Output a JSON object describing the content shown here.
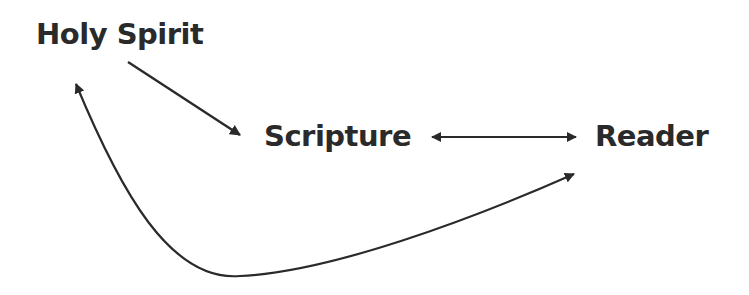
{
  "diagram": {
    "type": "flow-diagram",
    "colors": {
      "background": "#ffffff",
      "ink": "#2a2a2a"
    },
    "nodes": [
      {
        "id": "holy-spirit",
        "label": "Holy Spirit"
      },
      {
        "id": "scripture",
        "label": "Scripture"
      },
      {
        "id": "reader",
        "label": "Reader"
      }
    ],
    "edges": [
      {
        "from": "Holy Spirit",
        "to": "Scripture",
        "direction": "one-way",
        "shape": "straight"
      },
      {
        "from": "Scripture",
        "to": "Reader",
        "direction": "two-way",
        "shape": "straight"
      },
      {
        "from": "Reader",
        "to": "Holy Spirit",
        "direction": "two-way",
        "shape": "curved"
      }
    ]
  }
}
